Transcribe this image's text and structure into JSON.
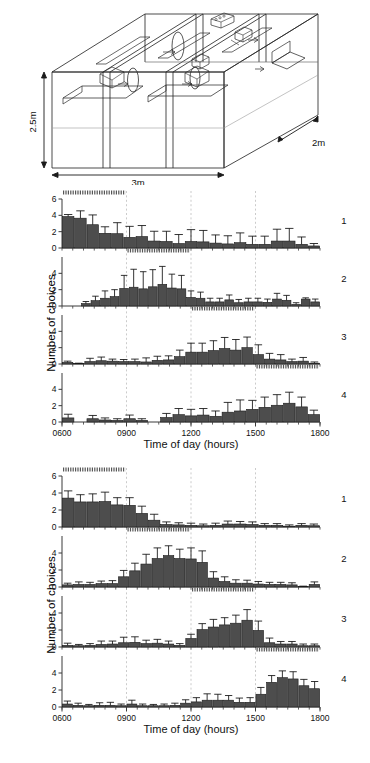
{
  "apparatus": {
    "name": "experimental-chamber-diagram",
    "dimension_height": "2.5m",
    "dimension_width": "3m",
    "dimension_depth": "2m"
  },
  "axis": {
    "ylabel": "Number of choices",
    "xlabel": "Time of day (hours)",
    "yticks": [
      "0",
      "2",
      "4",
      "6"
    ],
    "yticks_short": [
      "0",
      "2",
      "4"
    ],
    "xticks": [
      "0600",
      "0900",
      "1200",
      "1500",
      "1800"
    ],
    "ylim": [
      0,
      6
    ],
    "xlim": [
      600,
      1800
    ]
  },
  "panel_labels": [
    "1",
    "2",
    "3",
    "4"
  ],
  "colors": {
    "bar_fill": "#4d4d4d",
    "bar_stroke": "#1a1a1a",
    "axis": "#3a3a3a",
    "gridline": "#b5b5b5",
    "marker_bar": "#555555"
  },
  "chart_data": [
    {
      "id": "group-a-panel-1",
      "type": "bar",
      "title": "",
      "xlabel": "Time of day (hours)",
      "ylabel": "Number of choices",
      "ylim": [
        0,
        6
      ],
      "xlim": [
        600,
        1800
      ],
      "grid": true,
      "series_label": "1",
      "availability_window": [
        600,
        900
      ],
      "x": [
        630,
        660,
        690,
        720,
        750,
        780,
        810,
        840,
        870,
        900,
        930,
        960,
        990,
        1020,
        1050,
        1080,
        1110,
        1140,
        1170,
        1200,
        1230,
        1260,
        1290,
        1320,
        1350,
        1380,
        1410,
        1440,
        1470,
        1500,
        1530,
        1560,
        1590,
        1620,
        1650,
        1680,
        1710,
        1740,
        1770
      ],
      "categories": [
        "0600",
        "0630",
        "0700",
        "0730",
        "0800",
        "0830",
        "0900",
        "0930",
        "1000",
        "1030",
        "1100",
        "1130",
        "1200",
        "1230",
        "1300",
        "1330",
        "1400",
        "1430",
        "1500",
        "1530",
        "1600",
        "1630",
        "1700",
        "1730"
      ],
      "values": [
        3.85,
        3.65,
        2.85,
        1.8,
        1.75,
        1.3,
        1.4,
        0.85,
        0.8,
        0.55,
        0.8,
        0.75,
        0.6,
        0.5,
        0.65,
        0.45,
        0.45,
        0.85,
        0.85,
        0.45,
        0.25
      ],
      "errors": [
        0.25,
        0.9,
        1.2,
        0.8,
        1.35,
        1.35,
        1.35,
        1.2,
        1.25,
        1.1,
        1.45,
        1.4,
        1.0,
        1.0,
        1.2,
        1.0,
        1.0,
        1.45,
        1.55,
        0.9,
        0.3
      ]
    },
    {
      "id": "group-a-panel-2",
      "type": "bar",
      "series_label": "2",
      "ylim": [
        0,
        6
      ],
      "xlim": [
        600,
        1800
      ],
      "availability_window": [
        900,
        1200
      ],
      "values": [
        0,
        0,
        0.3,
        0.65,
        0.95,
        1.15,
        2.15,
        2.3,
        2.1,
        2.35,
        2.65,
        2.2,
        2.1,
        1.05,
        0.95,
        0.5,
        0.5,
        0.75,
        0.4,
        0.5,
        0.5,
        0.45,
        0.85,
        0.7,
        0.2,
        0.85,
        0.5
      ],
      "errors": [
        0,
        0,
        0.25,
        0.55,
        0.9,
        0.85,
        1.6,
        2.2,
        2.1,
        2.1,
        2.2,
        1.7,
        1.65,
        0.8,
        0.75,
        0.45,
        0.45,
        0.6,
        0.4,
        0.45,
        0.45,
        0.4,
        0.7,
        0.6,
        0.2,
        0.15,
        0.35
      ]
    },
    {
      "id": "group-a-panel-3",
      "type": "bar",
      "series_label": "3",
      "ylim": [
        0,
        6
      ],
      "xlim": [
        600,
        1800
      ],
      "availability_window": [
        1200,
        1500
      ],
      "values": [
        0.2,
        0.05,
        0.3,
        0.4,
        0.35,
        0.3,
        0.3,
        0.25,
        0.45,
        0.5,
        0.9,
        1.45,
        1.45,
        1.65,
        1.9,
        1.7,
        2.0,
        1.15,
        0.6,
        0.5,
        0.3,
        0.35,
        0.1
      ],
      "errors": [
        0.15,
        0.05,
        0.4,
        0.45,
        0.25,
        0.25,
        0.3,
        0.5,
        0.5,
        0.5,
        0.8,
        1.1,
        1.1,
        1.2,
        1.35,
        1.3,
        1.3,
        1.2,
        0.7,
        0.65,
        0.3,
        0.45,
        0.15
      ]
    },
    {
      "id": "group-a-panel-4",
      "type": "bar",
      "series_label": "4",
      "ylim": [
        0,
        6
      ],
      "xlim": [
        600,
        1800
      ],
      "availability_window": [
        1500,
        1800
      ],
      "values": [
        0.5,
        0,
        0.4,
        0.25,
        0.2,
        0.4,
        0.2,
        0,
        0.55,
        0.9,
        0.75,
        0.85,
        0.7,
        1.2,
        1.35,
        1.55,
        1.8,
        2.05,
        2.3,
        1.85,
        0.9
      ],
      "errors": [
        0.45,
        0,
        0.4,
        0.25,
        0.2,
        0.45,
        0.2,
        0,
        0.5,
        0.75,
        0.8,
        0.8,
        0.65,
        1.2,
        1.35,
        1.1,
        1.25,
        1.3,
        1.35,
        1.2,
        0.55
      ]
    },
    {
      "id": "group-b-panel-1",
      "type": "bar",
      "series_label": "1",
      "ylim": [
        0,
        6
      ],
      "xlim": [
        600,
        1800
      ],
      "availability_window": [
        600,
        900
      ],
      "values": [
        3.4,
        2.95,
        2.95,
        3.0,
        2.6,
        2.55,
        1.6,
        0.8,
        0.3,
        0.25,
        0.2,
        0.15,
        0.2,
        0.35,
        0.35,
        0.3,
        0.2,
        0.2,
        0.1,
        0.2,
        0.15
      ],
      "errors": [
        0.85,
        0.85,
        0.95,
        1.1,
        0.85,
        0.9,
        0.85,
        0.7,
        0.3,
        0.25,
        0.25,
        0.2,
        0.25,
        0.35,
        0.3,
        0.3,
        0.2,
        0.2,
        0.15,
        0.2,
        0.2
      ]
    },
    {
      "id": "group-b-panel-2",
      "type": "bar",
      "series_label": "2",
      "ylim": [
        0,
        6
      ],
      "xlim": [
        600,
        1800
      ],
      "availability_window": [
        900,
        1200
      ],
      "values": [
        0.25,
        0.3,
        0.3,
        0.4,
        0.4,
        1.2,
        1.9,
        2.7,
        3.35,
        3.7,
        3.35,
        3.3,
        2.9,
        1.05,
        0.65,
        0.45,
        0.45,
        0.35,
        0.3,
        0.3,
        0.25,
        0.05,
        0.3
      ],
      "errors": [
        0.2,
        0.3,
        0.25,
        0.3,
        0.35,
        0.75,
        0.9,
        1.15,
        1.25,
        1.15,
        1.1,
        1.3,
        1.35,
        0.75,
        0.55,
        0.4,
        0.35,
        0.3,
        0.25,
        0.25,
        0.25,
        0.05,
        0.3
      ]
    },
    {
      "id": "group-b-panel-3",
      "type": "bar",
      "series_label": "3",
      "ylim": [
        0,
        6
      ],
      "xlim": [
        600,
        1800
      ],
      "availability_window": [
        1200,
        1500
      ],
      "values": [
        0.2,
        0.15,
        0.2,
        0.3,
        0.35,
        0.5,
        0.55,
        0.4,
        0.45,
        0.35,
        0.2,
        1.0,
        2.05,
        2.35,
        2.6,
        2.8,
        3.15,
        1.95,
        0.5,
        0.35,
        0.35,
        0.15,
        0.15
      ],
      "errors": [
        0.25,
        0.15,
        0.2,
        0.4,
        0.35,
        0.65,
        0.65,
        0.4,
        0.45,
        0.35,
        0.2,
        0.5,
        0.7,
        0.9,
        0.85,
        0.95,
        1.25,
        1.1,
        0.55,
        0.3,
        0.3,
        0.2,
        0.2
      ]
    },
    {
      "id": "group-b-panel-4",
      "type": "bar",
      "series_label": "4",
      "ylim": [
        0,
        6
      ],
      "xlim": [
        600,
        1800
      ],
      "availability_window": [
        1500,
        1800
      ],
      "values": [
        0.35,
        0.2,
        0.15,
        0.2,
        0.2,
        0.15,
        0.35,
        0.15,
        0.15,
        0.15,
        0.2,
        0.45,
        0.6,
        0.8,
        0.8,
        0.8,
        0.55,
        0.55,
        1.5,
        2.9,
        3.45,
        3.3,
        2.5,
        2.15
      ],
      "errors": [
        0.35,
        0.25,
        0.15,
        0.3,
        0.35,
        0.2,
        0.45,
        0.2,
        0.15,
        0.2,
        0.25,
        0.4,
        0.5,
        0.75,
        0.7,
        0.55,
        0.5,
        0.55,
        0.8,
        0.8,
        0.8,
        0.85,
        0.75,
        0.85
      ]
    }
  ]
}
